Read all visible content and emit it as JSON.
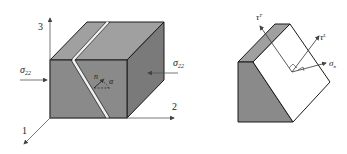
{
  "figure": {
    "left_panel": {
      "axes": {
        "axis_1": "1",
        "axis_2": "2",
        "axis_3": "3"
      },
      "load_left": {
        "symbol": "σ",
        "subscript": "22"
      },
      "load_right": {
        "symbol": "σ",
        "subscript": "22"
      },
      "normal": "n",
      "angle": "α"
    },
    "right_panel": {
      "shear_transverse": {
        "symbol": "τ",
        "superscript": "T"
      },
      "shear_longitudinal": {
        "symbol": "τ",
        "superscript": "L"
      },
      "normal_stress": {
        "symbol": "σ",
        "subscript": "n"
      }
    },
    "colors": {
      "front_face": "#8a8a8a",
      "top_face": "#a0a0a0",
      "side_face": "#7a7a7a",
      "outline": "#1a1a1a",
      "arrow": "#555555"
    }
  }
}
